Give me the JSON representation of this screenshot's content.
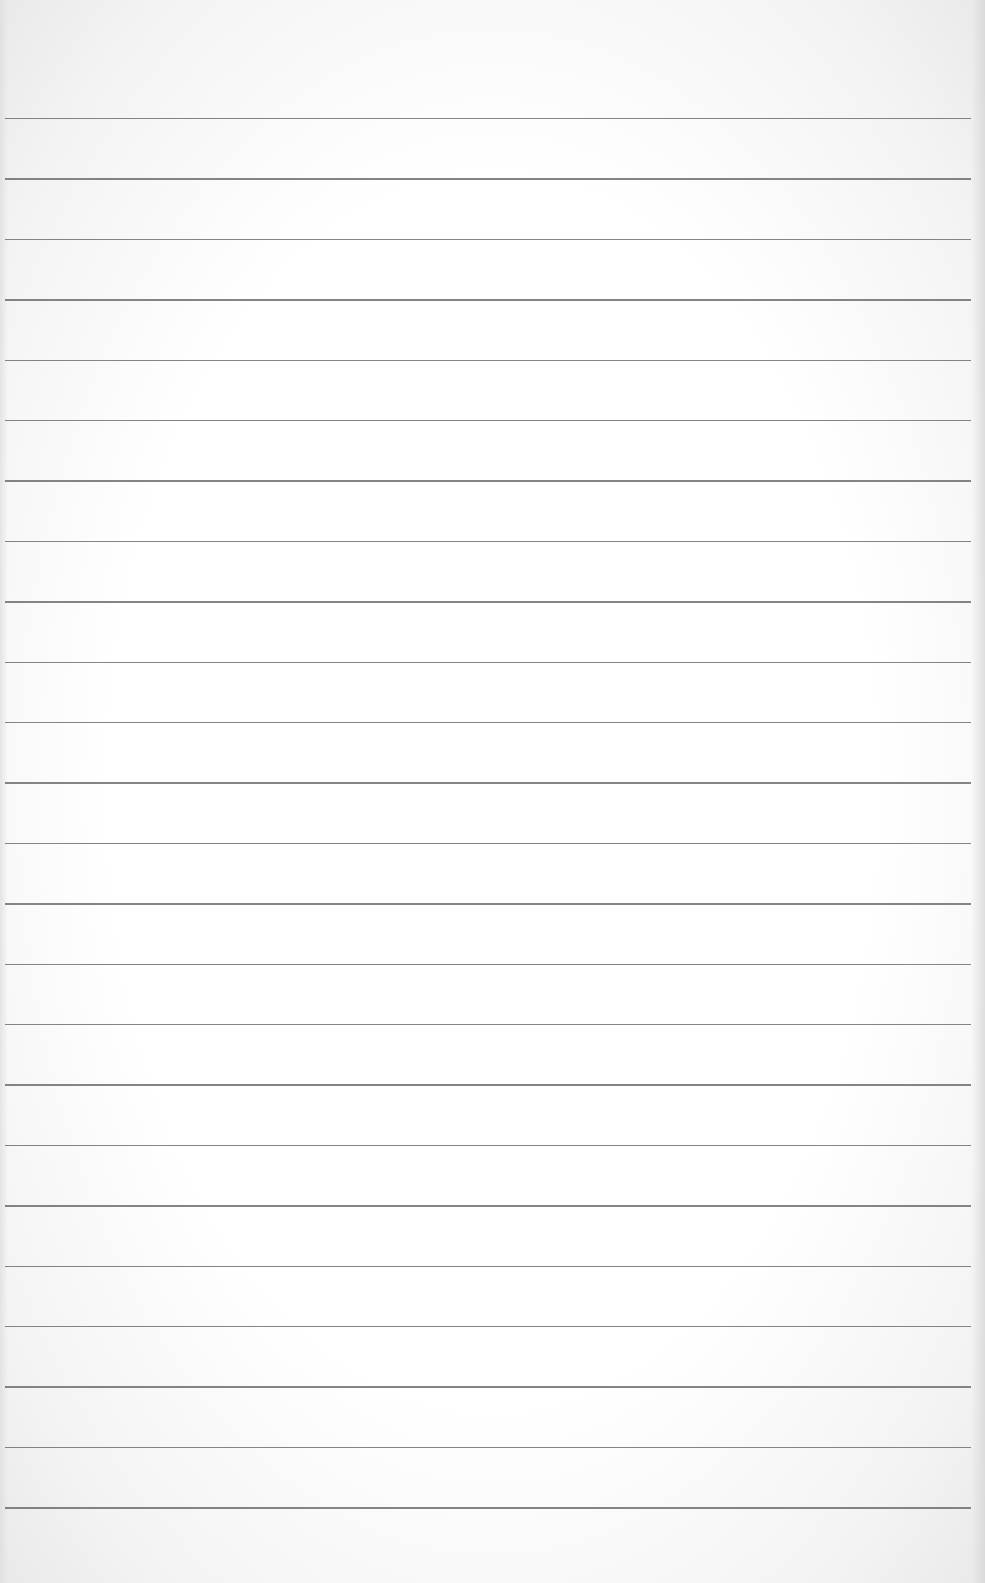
{
  "image": {
    "description": "Blank lined notebook paper",
    "background_color": "#ffffff",
    "line_color": "#6e6e6e",
    "line_count": 24,
    "first_line_y": 118,
    "line_spacing": 60.4,
    "line_left_x": 5,
    "line_right_x": 971
  }
}
